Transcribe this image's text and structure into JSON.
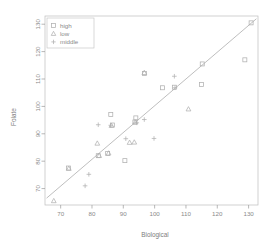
{
  "chart_data": {
    "type": "scatter",
    "title": "",
    "xlabel": "Biological",
    "ylabel": "Folate",
    "xlim": [
      65,
      133
    ],
    "ylim": [
      64,
      133
    ],
    "xticks": [
      70,
      80,
      90,
      100,
      110,
      120,
      130
    ],
    "yticks": [
      70,
      80,
      90,
      100,
      110,
      120,
      130
    ],
    "grid": false,
    "legend": {
      "position": "top-left",
      "entries": [
        {
          "label": "high",
          "marker": "square"
        },
        {
          "label": "low",
          "marker": "triangle"
        },
        {
          "label": "middle",
          "marker": "plus"
        }
      ]
    },
    "reference_line": {
      "type": "line",
      "x": [
        65.5,
        132.5
      ],
      "y": [
        66.5,
        132.0
      ],
      "description": "regression line"
    },
    "series": [
      {
        "name": "high",
        "marker": "square",
        "points": [
          [
            72.5,
            77.5
          ],
          [
            82.0,
            82.0
          ],
          [
            85.0,
            82.8
          ],
          [
            86.0,
            97.0
          ],
          [
            86.5,
            93.2
          ],
          [
            90.5,
            80.2
          ],
          [
            93.7,
            94.3
          ],
          [
            94.0,
            95.8
          ],
          [
            96.8,
            112.0
          ],
          [
            102.5,
            106.8
          ],
          [
            106.3,
            107.0
          ],
          [
            115.0,
            108.0
          ],
          [
            115.2,
            115.5
          ],
          [
            128.8,
            117.0
          ],
          [
            130.8,
            130.5
          ]
        ]
      },
      {
        "name": "low",
        "marker": "triangle",
        "points": [
          [
            67.8,
            65.5
          ],
          [
            72.6,
            77.3
          ],
          [
            81.7,
            86.5
          ],
          [
            82.3,
            82.0
          ],
          [
            85.3,
            82.9
          ],
          [
            86.2,
            93.0
          ],
          [
            92.0,
            86.8
          ],
          [
            93.5,
            86.9
          ],
          [
            93.8,
            94.2
          ],
          [
            96.7,
            112.3
          ],
          [
            110.8,
            99.0
          ]
        ]
      },
      {
        "name": "middle",
        "marker": "plus",
        "points": [
          [
            77.8,
            71.0
          ],
          [
            79.0,
            75.2
          ],
          [
            82.0,
            93.3
          ],
          [
            86.0,
            93.1
          ],
          [
            90.8,
            88.2
          ],
          [
            94.3,
            94.0
          ],
          [
            96.7,
            95.2
          ],
          [
            99.8,
            88.3
          ],
          [
            106.3,
            111.0
          ],
          [
            106.5,
            106.8
          ]
        ]
      }
    ]
  },
  "axes": {
    "x_tick_labels": [
      "70",
      "80",
      "90",
      "100",
      "110",
      "120",
      "130"
    ],
    "y_tick_labels": [
      "70",
      "80",
      "90",
      "100",
      "110",
      "120",
      "130"
    ],
    "x_title": "Biological",
    "y_title": "Folate"
  },
  "legend": {
    "items": [
      {
        "label": "high"
      },
      {
        "label": "low"
      },
      {
        "label": "middle"
      }
    ]
  }
}
